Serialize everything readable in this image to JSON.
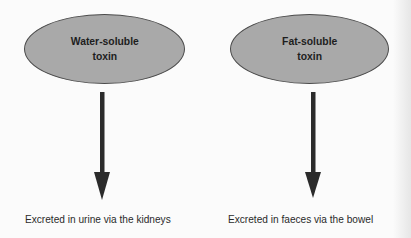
{
  "diagram": {
    "nodes": [
      {
        "id": "water",
        "label": "Water-soluble\ntoxin",
        "outcome": "Excreted in urine via the kidneys"
      },
      {
        "id": "fat",
        "label": "Fat-soluble\ntoxin",
        "outcome": "Excreted in faeces via the bowel"
      }
    ],
    "colors": {
      "ellipse_fill": "#a9a9a9",
      "ellipse_border": "#4a4a4a",
      "arrow": "#2b2b2b",
      "text": "#2a2a2a"
    }
  }
}
